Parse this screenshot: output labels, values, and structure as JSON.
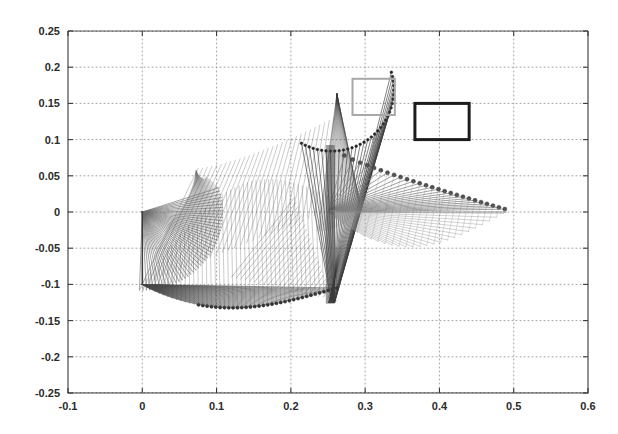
{
  "chart_data": {
    "type": "line",
    "title": "",
    "subtitle": "",
    "xlabel": "",
    "ylabel": "",
    "xlim": [
      -0.1,
      0.6
    ],
    "ylim": [
      -0.25,
      0.25
    ],
    "grid": true,
    "legend": "none",
    "background": "#ffffff",
    "axis_color": "#3a3a3a",
    "grid_color": "#9a9a9a",
    "xticks": [
      -0.1,
      0,
      0.1,
      0.2,
      0.3,
      0.4,
      0.5,
      0.6
    ],
    "xtick_labels": [
      "-0.1",
      "0",
      "0.1",
      "0.2",
      "0.3",
      "0.4",
      "0.5",
      "0.6"
    ],
    "yticks": [
      -0.25,
      -0.2,
      -0.15,
      -0.1,
      -0.05,
      0,
      0.05,
      0.1,
      0.15,
      0.2,
      0.25
    ],
    "ytick_labels": [
      "-0.25",
      "-0.2",
      "-0.15",
      "-0.1",
      "-0.05",
      "0",
      "0.05",
      "0.1",
      "0.15",
      "0.2",
      "0.25"
    ],
    "series": [
      {
        "name": "arm-sweep-a",
        "color": "#6f6f6f",
        "marker": "circle",
        "base": [
          0.0,
          0.0
        ],
        "n_segments": 46,
        "comment": "fan from base (0,0) sweeping down-right to elbow arc",
        "elbow_arc": {
          "cx": 0.0,
          "cy": 0.0,
          "r": 0.108,
          "a0": -92,
          "a1": 18
        },
        "tip_arc": {
          "cx": 0.072,
          "cy": 0.061,
          "r": 0.0,
          "a0": 0,
          "a1": 0
        }
      },
      {
        "name": "arm-sweep-b",
        "color": "#4a4a4a",
        "marker": "circle",
        "base": [
          0.0,
          -0.1
        ],
        "n_segments": 46,
        "comment": "lower fan from (0,-0.1) sweeping right along lower envelope to (0.26,-0.125)"
      },
      {
        "name": "arm-sweep-c",
        "color": "#3b3b3b",
        "marker": "circle",
        "base": [
          0.23,
          -0.125
        ],
        "n_segments": 34,
        "comment": "dense bundle rising to peak near (0.25,0.165)"
      },
      {
        "name": "arm-sweep-d",
        "color": "#7d7d7d",
        "marker": "circle",
        "base": [
          0.25,
          0.0
        ],
        "n_segments": 26,
        "comment": "radiating spokes with endpoint dots from (0.25,0) fanning right to (0.49,0.0)"
      }
    ],
    "key_points": {
      "origin": [
        0.0,
        0.0
      ],
      "left_peak": [
        0.072,
        0.061
      ],
      "top_peak": [
        0.25,
        0.165
      ],
      "lower_cluster": [
        0.255,
        -0.125
      ],
      "right_tip": [
        0.49,
        0.0
      ],
      "left_base_bottom": [
        0.0,
        -0.1
      ]
    },
    "annotations": [
      {
        "name": "light-gray-rectangle",
        "type": "rect",
        "x": 0.283,
        "y": 0.134,
        "width": 0.057,
        "height": 0.05,
        "stroke": "#a8a8a8",
        "stroke_width": 2,
        "fill": "none"
      },
      {
        "name": "black-rectangle",
        "type": "rect",
        "x": 0.367,
        "y": 0.1,
        "width": 0.073,
        "height": 0.05,
        "stroke": "#1c1c1c",
        "stroke_width": 3,
        "fill": "none"
      }
    ]
  }
}
